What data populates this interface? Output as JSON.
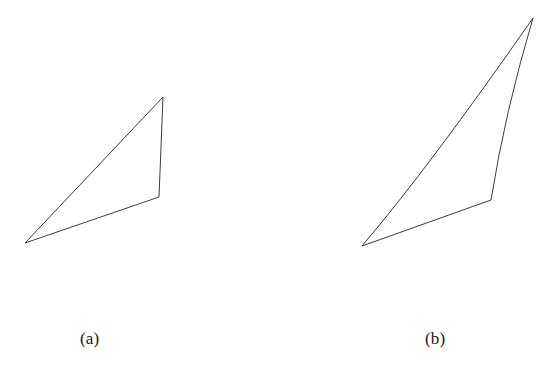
{
  "figure": {
    "background_color": "#ffffff",
    "stroke_color": "#3c3c3c",
    "stroke_width": 1,
    "width": 555,
    "height": 378
  },
  "panels": [
    {
      "id": "panel-a",
      "label": "(a)",
      "label_position": {
        "x": 80,
        "y": 329
      },
      "description": "straight-edged triangle",
      "vertices": [
        {
          "name": "apex",
          "x": 163,
          "y": 97
        },
        {
          "name": "right-middle",
          "x": 159,
          "y": 197
        },
        {
          "name": "bottom-left",
          "x": 25,
          "y": 243
        }
      ],
      "edges": [
        {
          "name": "hypotenuse",
          "from": "bottom-left",
          "to": "apex",
          "curved": false,
          "control": null
        },
        {
          "name": "right-edge",
          "from": "apex",
          "to": "right-middle",
          "curved": false,
          "control": null
        },
        {
          "name": "bottom-edge",
          "from": "right-middle",
          "to": "bottom-left",
          "curved": false,
          "control": null
        }
      ],
      "path": "M 25 243 L 163 97 L 159 197 Z"
    },
    {
      "id": "panel-b",
      "label": "(b)",
      "label_position": {
        "x": 425,
        "y": 329
      },
      "description": "triangle with outward-bowed hypotenuse and inward-bowed right edge",
      "vertices": [
        {
          "name": "apex",
          "x": 533,
          "y": 18
        },
        {
          "name": "right-middle",
          "x": 491,
          "y": 200
        },
        {
          "name": "bottom-left",
          "x": 362,
          "y": 246
        }
      ],
      "edges": [
        {
          "name": "hypotenuse",
          "from": "bottom-left",
          "to": "apex",
          "curved": true,
          "control": {
            "x": 430,
            "y": 166
          }
        },
        {
          "name": "right-edge",
          "from": "apex",
          "to": "right-middle",
          "curved": true,
          "control": {
            "x": 505,
            "y": 112
          }
        },
        {
          "name": "bottom-edge",
          "from": "right-middle",
          "to": "bottom-left",
          "curved": false,
          "control": null
        }
      ],
      "path": "M 362 246 Q 430 166 533 18 Q 505 112 491 200 Z"
    }
  ]
}
